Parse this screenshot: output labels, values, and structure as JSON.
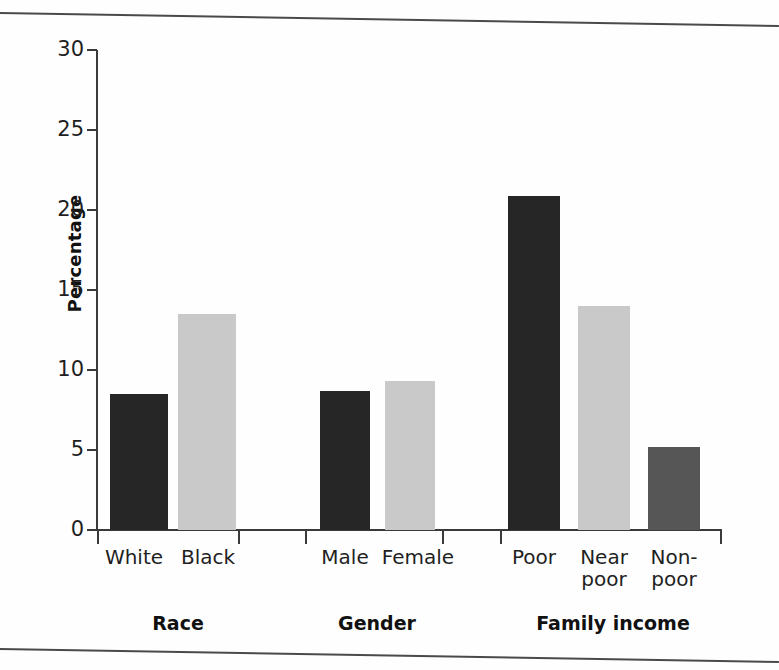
{
  "chart_data": {
    "type": "bar",
    "title": "",
    "subtitle": "",
    "xlabel": "",
    "ylabel": "Percentage",
    "ylim": [
      0,
      30
    ],
    "yticks": [
      0,
      5,
      10,
      15,
      20,
      25,
      30
    ],
    "ytick_labels": [
      "0",
      "5",
      "10",
      "15",
      "20",
      "25",
      "30"
    ],
    "grid": false,
    "legend": null,
    "legend_position": "none",
    "annotations": [],
    "groups": [
      {
        "name": "Race",
        "group_label": "Race",
        "categories": [
          "White",
          "Black"
        ],
        "values": [
          8.5,
          13.5
        ],
        "colors": [
          "#262626",
          "#c9c9c9"
        ],
        "shades": [
          "dark",
          "light"
        ]
      },
      {
        "name": "Gender",
        "group_label": "Gender",
        "categories": [
          "Male",
          "Female"
        ],
        "values": [
          8.7,
          9.3
        ],
        "colors": [
          "#262626",
          "#c9c9c9"
        ],
        "shades": [
          "dark",
          "light"
        ]
      },
      {
        "name": "Family income",
        "group_label": "Family income",
        "categories": [
          "Poor",
          "Near poor",
          "Non- poor"
        ],
        "values": [
          20.9,
          14.0,
          5.2
        ],
        "colors": [
          "#262626",
          "#c9c9c9",
          "#565656"
        ],
        "shades": [
          "dark",
          "light",
          "mid"
        ]
      }
    ],
    "categories": [
      "White",
      "Black",
      "Male",
      "Female",
      "Poor",
      "Near poor",
      "Non-poor"
    ],
    "values": [
      8.5,
      13.5,
      8.7,
      9.3,
      20.9,
      14.0,
      5.2
    ]
  },
  "axis": {
    "y_label": "Percentage",
    "y_ticks": [
      {
        "value": 30,
        "label": "30"
      },
      {
        "value": 25,
        "label": "25"
      },
      {
        "value": 20,
        "label": "20"
      },
      {
        "value": 15,
        "label": "15"
      },
      {
        "value": 10,
        "label": "10"
      },
      {
        "value": 5,
        "label": "5"
      },
      {
        "value": 0,
        "label": "0"
      }
    ]
  },
  "bars": [
    {
      "name": "bar-white",
      "label": "White",
      "value": 8.5,
      "shade": "dark",
      "color": "#262626",
      "left": 110,
      "width": 58
    },
    {
      "name": "bar-black",
      "label": "Black",
      "value": 13.5,
      "shade": "light",
      "color": "#c9c9c9",
      "left": 178,
      "width": 58
    },
    {
      "name": "bar-male",
      "label": "Male",
      "value": 8.7,
      "shade": "dark",
      "color": "#262626",
      "left": 320,
      "width": 50
    },
    {
      "name": "bar-female",
      "label": "Female",
      "value": 9.3,
      "shade": "light",
      "color": "#c9c9c9",
      "left": 385,
      "width": 50
    },
    {
      "name": "bar-poor",
      "label": "Poor",
      "value": 20.9,
      "shade": "dark",
      "color": "#262626",
      "left": 508,
      "width": 52
    },
    {
      "name": "bar-near-poor",
      "label": "Near poor",
      "value": 14.0,
      "shade": "light",
      "color": "#c9c9c9",
      "left": 578,
      "width": 52
    },
    {
      "name": "bar-non-poor",
      "label": "Non-poor",
      "value": 5.2,
      "shade": "mid",
      "color": "#565656",
      "left": 648,
      "width": 52
    }
  ],
  "category_labels": [
    {
      "name": "cat-label-white",
      "text": "White",
      "left": 98,
      "width": 72
    },
    {
      "name": "cat-label-black",
      "text": "Black",
      "left": 172,
      "width": 72
    },
    {
      "name": "cat-label-male",
      "text": "Male",
      "left": 310,
      "width": 70
    },
    {
      "name": "cat-label-female",
      "text": "Female",
      "left": 378,
      "width": 80
    },
    {
      "name": "cat-label-poor",
      "text": "Poor",
      "left": 498,
      "width": 72
    },
    {
      "name": "cat-label-near-poor",
      "text": "Near\npoor",
      "left": 568,
      "width": 72
    },
    {
      "name": "cat-label-non-poor",
      "text": "Non-\npoor",
      "left": 638,
      "width": 72
    }
  ],
  "group_labels": [
    {
      "name": "group-label-race",
      "text": "Race",
      "left": 128,
      "width": 100
    },
    {
      "name": "group-label-gender",
      "text": "Gender",
      "left": 322,
      "width": 110
    },
    {
      "name": "group-label-family-income",
      "text": "Family income",
      "left": 518,
      "width": 190
    }
  ],
  "x_ticks": [
    97,
    238,
    305,
    442,
    500,
    720
  ],
  "colors": {
    "dark": "#262626",
    "light": "#c9c9c9",
    "mid": "#565656",
    "axis": "#3a3a3a",
    "rule": "#4a4a4a",
    "background": "#ffffff"
  }
}
